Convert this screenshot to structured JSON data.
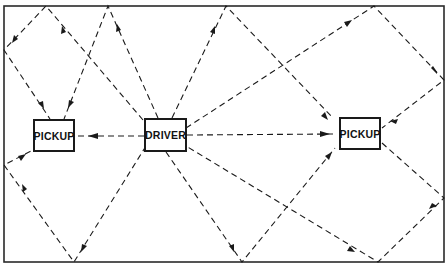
{
  "diagram": {
    "type": "signal-reflection-diagram",
    "frame": {
      "x": 4,
      "y": 6,
      "width": 440,
      "height": 257
    },
    "line_color": "#1a1a1a",
    "nodes": [
      {
        "id": "pickup-left",
        "label": "PICKUP",
        "x": 33,
        "y": 119,
        "w": 42,
        "h": 33
      },
      {
        "id": "driver",
        "label": "DRIVER",
        "x": 144,
        "y": 118,
        "w": 43,
        "h": 34
      },
      {
        "id": "pickup-right",
        "label": "PICKUP",
        "x": 339,
        "y": 117,
        "w": 42,
        "h": 33
      }
    ],
    "paths": [
      {
        "from": "driver",
        "to": "pickup-left",
        "note": "direct"
      },
      {
        "from": "driver",
        "to": "pickup-right",
        "note": "direct"
      },
      {
        "from": "driver",
        "to": "pickup-left",
        "note": "reflected via top and left walls"
      },
      {
        "from": "driver",
        "to": "pickup-left",
        "note": "reflected via top wall"
      },
      {
        "from": "driver",
        "to": "pickup-right",
        "note": "reflected via top wall"
      },
      {
        "from": "driver",
        "to": "pickup-right",
        "note": "reflected via top and right walls"
      },
      {
        "from": "driver",
        "to": "pickup-right",
        "note": "reflected via bottom wall"
      },
      {
        "from": "driver",
        "to": "pickup-right",
        "note": "reflected via bottom and right walls"
      },
      {
        "from": "driver",
        "to": "pickup-left",
        "note": "reflected via bottom and left walls"
      }
    ]
  }
}
